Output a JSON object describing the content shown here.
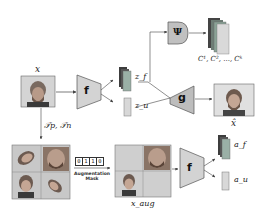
{
  "diagram": {
    "title": "",
    "nodes": {
      "input_image": {
        "label": "x"
      },
      "encoder_top": {
        "label": "f"
      },
      "decoder": {
        "label": "g"
      },
      "classifier": {
        "label": "Ψ"
      },
      "encoder_bottom": {
        "label": "f"
      },
      "reconstruction": {
        "label": "x̂"
      },
      "z_f": {
        "label": "z_f"
      },
      "z_u": {
        "label": "z_u"
      },
      "a_f": {
        "label": "a_f"
      },
      "a_u": {
        "label": "a_u"
      },
      "class_outputs": {
        "label": "C¹, C², ..., Cᵏ"
      },
      "augmented_input": {
        "label": "x_aug"
      },
      "transforms": {
        "label": "𝒯p, 𝒯n"
      }
    },
    "augmentation_mask": {
      "bits": [
        "0",
        "1",
        "1",
        "0"
      ],
      "label_line1": "Augmentation",
      "label_line2": "Mask"
    },
    "colors": {
      "network_fill": "#c9c9c9",
      "network_stroke": "#555555",
      "classifier_fill": "#b9b9b9",
      "feature_dark": "#555555",
      "feature_mid": "#8a8a8a",
      "feature_light": "#cfcfcf",
      "image_bg": "#d0d0d0",
      "arrow": "#444444"
    }
  }
}
